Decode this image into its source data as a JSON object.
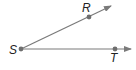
{
  "diagram": {
    "type": "angle",
    "colors": {
      "ray": "#7a7a7a",
      "point": "#6e6e6e",
      "label": "#222222",
      "background": "#ffffff"
    },
    "vertex": {
      "label": "S",
      "x": 21,
      "y": 49
    },
    "rays": [
      {
        "name": "ray-SR",
        "from": "S",
        "through": "R",
        "end": {
          "x": 111,
          "y": 6
        }
      },
      {
        "name": "ray-ST",
        "from": "S",
        "through": "T",
        "end": {
          "x": 131,
          "y": 49
        }
      }
    ],
    "points": [
      {
        "label": "S",
        "x": 21,
        "y": 49,
        "label_x": 9,
        "label_y": 54
      },
      {
        "label": "R",
        "x": 89,
        "y": 17,
        "label_x": 82,
        "label_y": 12
      },
      {
        "label": "T",
        "x": 115,
        "y": 49,
        "label_x": 110,
        "label_y": 62
      }
    ]
  }
}
